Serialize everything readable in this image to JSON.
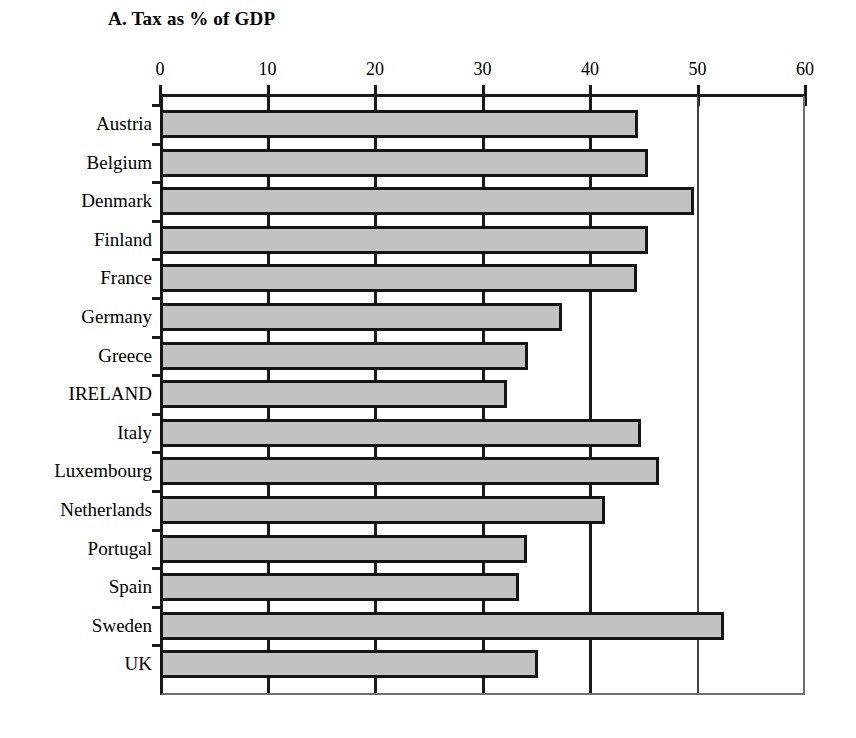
{
  "chart_data": {
    "type": "bar",
    "orientation": "horizontal",
    "title": "A. Tax as % of GDP",
    "xlabel": "",
    "ylabel": "",
    "xlim": [
      0,
      60
    ],
    "ylim": null,
    "grid": true,
    "grid_axis": "x",
    "legend": null,
    "axis_position": "top",
    "xticks": [
      0,
      10,
      20,
      30,
      40,
      50,
      60
    ],
    "xtick_labels": [
      "0",
      "10",
      "20",
      "30",
      "40",
      "50",
      "60"
    ],
    "categories": [
      "Austria",
      "Belgium",
      "Denmark",
      "Finland",
      "France",
      "Germany",
      "Greece",
      "IRELAND",
      "Italy",
      "Luxembourg",
      "Netherlands",
      "Portugal",
      "Spain",
      "Sweden",
      "UK"
    ],
    "values": [
      44.5,
      45.4,
      49.7,
      45.4,
      44.4,
      37.4,
      34.2,
      32.3,
      44.7,
      46.4,
      41.4,
      34.1,
      33.4,
      52.5,
      35.2
    ],
    "bar_fill_color": "#c2c2c2",
    "bar_edge_color": "#141414",
    "axis_color": "#1a1a1a",
    "background_color": "#ffffff"
  }
}
